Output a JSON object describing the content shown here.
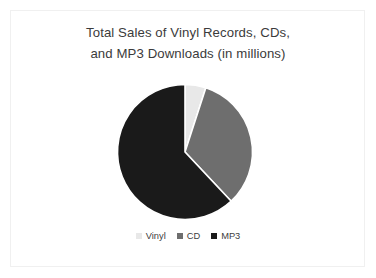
{
  "slide": {
    "background_color": "#ffffff",
    "border_color": "#f0f0f0"
  },
  "chart_data": {
    "type": "pie",
    "title": "Total Sales of Vinyl Records, CDs, and MP3 Downloads (in millions)",
    "title_lines": [
      "Total Sales of Vinyl Records, CDs,",
      "and MP3 Downloads (in millions)"
    ],
    "categories": [
      "Vinyl",
      "CD",
      "MP3"
    ],
    "values": [
      5,
      33,
      62
    ],
    "unit": "millions",
    "colors": [
      "#e8e8e8",
      "#6e6e6e",
      "#1a1a1a"
    ],
    "legend_position": "bottom",
    "grid": false,
    "start_angle_deg": 0,
    "direction": "clockwise",
    "xlabel": "",
    "ylabel": ""
  },
  "legend": {
    "items": [
      {
        "label": "Vinyl",
        "color": "#e8e8e8"
      },
      {
        "label": "CD",
        "color": "#6e6e6e"
      },
      {
        "label": "MP3",
        "color": "#1a1a1a"
      }
    ]
  }
}
